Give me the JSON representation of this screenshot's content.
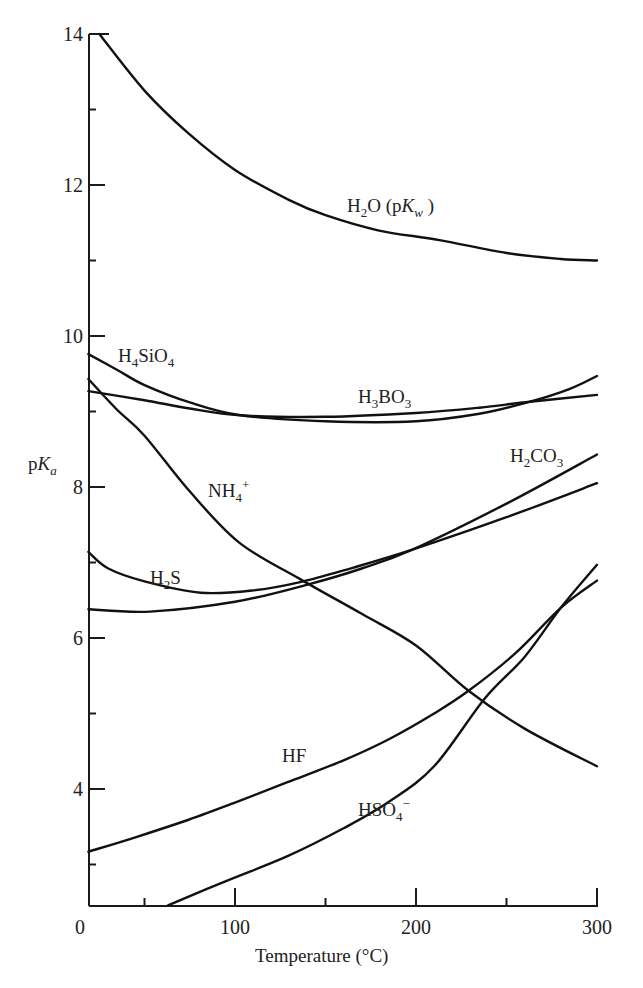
{
  "chart_data": {
    "type": "line",
    "title": "",
    "xlabel": "Temperature (°C)",
    "ylabel": "pKa",
    "xlim": [
      19,
      300
    ],
    "ylim": [
      2.46,
      14
    ],
    "grid": false,
    "legend": "inline labels",
    "x_ticks": {
      "major": [
        0,
        100,
        200,
        300
      ],
      "minor": [
        50,
        150,
        250
      ]
    },
    "y_ticks": {
      "major": [
        4,
        6,
        8,
        10,
        12,
        14
      ],
      "minor": [
        3,
        5,
        7,
        9,
        11,
        13
      ]
    },
    "series": [
      {
        "name": "H2O (pKw)",
        "label_parts": [
          [
            "H",
            ""
          ],
          [
            "2",
            "sub"
          ],
          [
            "O (p",
            ""
          ],
          [
            "K",
            "i"
          ],
          [
            "w",
            "subi"
          ],
          [
            " )",
            ""
          ]
        ],
        "label_pos": [
          347,
          212
        ],
        "points": [
          [
            25,
            14.0
          ],
          [
            50,
            13.25
          ],
          [
            74,
            12.69
          ],
          [
            100,
            12.2
          ],
          [
            130,
            11.8
          ],
          [
            150,
            11.6
          ],
          [
            179,
            11.4
          ],
          [
            213,
            11.27
          ],
          [
            250,
            11.1
          ],
          [
            280,
            11.02
          ],
          [
            300,
            11.0
          ]
        ]
      },
      {
        "name": "H4SiO4",
        "label_parts": [
          [
            "H",
            ""
          ],
          [
            "4",
            "sub"
          ],
          [
            "SiO",
            ""
          ],
          [
            "4",
            "sub"
          ]
        ],
        "label_pos": [
          118,
          362
        ],
        "points": [
          [
            19,
            9.76
          ],
          [
            35,
            9.55
          ],
          [
            50,
            9.35
          ],
          [
            75,
            9.12
          ],
          [
            103,
            8.95
          ],
          [
            150,
            8.87
          ],
          [
            200,
            8.87
          ],
          [
            235,
            8.97
          ],
          [
            263,
            9.13
          ],
          [
            285,
            9.3
          ],
          [
            300,
            9.47
          ]
        ]
      },
      {
        "name": "H3BO3",
        "label_parts": [
          [
            "H",
            ""
          ],
          [
            "3",
            "sub"
          ],
          [
            "BO",
            ""
          ],
          [
            "3",
            "sub"
          ]
        ],
        "label_pos": [
          358,
          403
        ],
        "points": [
          [
            19,
            9.27
          ],
          [
            50,
            9.15
          ],
          [
            75,
            9.04
          ],
          [
            103,
            8.95
          ],
          [
            150,
            8.93
          ],
          [
            200,
            8.98
          ],
          [
            235,
            9.05
          ],
          [
            263,
            9.13
          ],
          [
            300,
            9.22
          ]
        ]
      },
      {
        "name": "NH4+",
        "label_parts": [
          [
            "NH",
            ""
          ],
          [
            "4",
            "sub"
          ],
          [
            "+",
            "sup"
          ]
        ],
        "label_pos": [
          208,
          497
        ],
        "points": [
          [
            19,
            9.43
          ],
          [
            35,
            9.02
          ],
          [
            50,
            8.68
          ],
          [
            74,
            7.97
          ],
          [
            102,
            7.27
          ],
          [
            136,
            6.78
          ],
          [
            170,
            6.32
          ],
          [
            200,
            5.9
          ],
          [
            229,
            5.3
          ],
          [
            260,
            4.8
          ],
          [
            300,
            4.3
          ]
        ]
      },
      {
        "name": "H2S",
        "label_parts": [
          [
            "H",
            ""
          ],
          [
            "2",
            "sub"
          ],
          [
            "S",
            ""
          ]
        ],
        "label_pos": [
          150,
          584
        ],
        "points": [
          [
            19,
            7.14
          ],
          [
            30,
            6.92
          ],
          [
            50,
            6.75
          ],
          [
            81,
            6.6
          ],
          [
            110,
            6.63
          ],
          [
            136,
            6.74
          ],
          [
            165,
            6.93
          ],
          [
            198,
            7.17
          ],
          [
            250,
            7.6
          ],
          [
            300,
            8.05
          ]
        ]
      },
      {
        "name": "H2CO3",
        "label_parts": [
          [
            "H",
            ""
          ],
          [
            "2",
            "sub"
          ],
          [
            "CO",
            ""
          ],
          [
            "3",
            "sub"
          ]
        ],
        "label_pos": [
          510,
          462
        ],
        "points": [
          [
            19,
            6.38
          ],
          [
            53,
            6.35
          ],
          [
            100,
            6.48
          ],
          [
            139,
            6.7
          ],
          [
            170,
            6.92
          ],
          [
            198,
            7.17
          ],
          [
            250,
            7.78
          ],
          [
            300,
            8.43
          ]
        ]
      },
      {
        "name": "HF",
        "label_parts": [
          [
            "HF",
            ""
          ]
        ],
        "label_pos": [
          282,
          762
        ],
        "points": [
          [
            19,
            3.17
          ],
          [
            45,
            3.36
          ],
          [
            74,
            3.59
          ],
          [
            100,
            3.82
          ],
          [
            129,
            4.09
          ],
          [
            160,
            4.38
          ],
          [
            185,
            4.66
          ],
          [
            210,
            5.0
          ],
          [
            229,
            5.3
          ],
          [
            255,
            5.8
          ],
          [
            280,
            6.4
          ],
          [
            300,
            6.76
          ]
        ]
      },
      {
        "name": "HSO4-",
        "label_parts": [
          [
            "HSO",
            ""
          ],
          [
            "4",
            "sub"
          ],
          [
            "−",
            "sup"
          ]
        ],
        "label_pos": [
          358,
          816
        ],
        "points": [
          [
            63,
            2.46
          ],
          [
            95,
            2.78
          ],
          [
            129,
            3.11
          ],
          [
            160,
            3.48
          ],
          [
            185,
            3.83
          ],
          [
            210,
            4.3
          ],
          [
            238,
            5.2
          ],
          [
            260,
            5.75
          ],
          [
            280,
            6.4
          ],
          [
            300,
            6.97
          ]
        ]
      }
    ]
  },
  "axes": {
    "x_title": "Temperature (°C)",
    "y_title_main": "p",
    "y_title_italic": "K",
    "y_title_sub": "a",
    "x_tick_labels": [
      "0",
      "100",
      "200",
      "300"
    ],
    "y_tick_labels": [
      "4",
      "6",
      "8",
      "10",
      "12",
      "14"
    ]
  }
}
